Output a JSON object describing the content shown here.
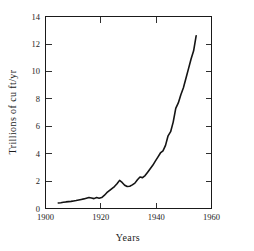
{
  "chart_data": {
    "type": "line",
    "title": "",
    "subtitle": "",
    "xlabel": "Years",
    "ylabel": "Trillions of cu ft/yr",
    "xlim": [
      1900,
      1965
    ],
    "ylim": [
      0,
      14
    ],
    "xticks": [
      1900,
      1920,
      1940,
      1960
    ],
    "xtick_labels": [
      "1900",
      "1920",
      "1940",
      "1960"
    ],
    "yticks": [
      0,
      2,
      4,
      6,
      8,
      10,
      12,
      14
    ],
    "ytick_labels": [
      "0",
      "2",
      "4",
      "6",
      "8",
      "10",
      "12",
      "14"
    ],
    "grid": false,
    "legend": false,
    "legend_position": "none",
    "frame": "box",
    "tick_direction": "in",
    "line_color": "#141414",
    "series": [
      {
        "name": "Natural gas production",
        "x": [
          1905,
          1906,
          1907,
          1908,
          1909,
          1910,
          1911,
          1912,
          1913,
          1914,
          1915,
          1916,
          1917,
          1918,
          1919,
          1920,
          1921,
          1922,
          1923,
          1924,
          1925,
          1926,
          1927,
          1928,
          1929,
          1930,
          1931,
          1932,
          1933,
          1934,
          1935,
          1936,
          1937,
          1938,
          1939,
          1940,
          1941,
          1942,
          1943,
          1944,
          1945,
          1946,
          1947,
          1948,
          1949,
          1950,
          1951,
          1952,
          1953,
          1954,
          1955,
          1956,
          1957,
          1958,
          1959
        ],
        "values": [
          0.4,
          0.42,
          0.45,
          0.48,
          0.5,
          0.52,
          0.55,
          0.58,
          0.62,
          0.66,
          0.7,
          0.75,
          0.8,
          0.76,
          0.72,
          0.8,
          0.75,
          0.8,
          0.95,
          1.15,
          1.3,
          1.45,
          1.6,
          1.8,
          2.05,
          1.9,
          1.7,
          1.6,
          1.62,
          1.72,
          1.85,
          2.1,
          2.3,
          2.25,
          2.4,
          2.65,
          2.9,
          3.15,
          3.45,
          3.75,
          4.05,
          4.2,
          4.6,
          5.3,
          5.6,
          6.3,
          7.3,
          7.7,
          8.3,
          8.8,
          9.5,
          10.2,
          10.9,
          11.5,
          12.6
        ]
      }
    ]
  },
  "axes": {
    "y_title": "Trillions of cu ft/yr",
    "x_title": "Years"
  },
  "ytick_labels": {
    "t0": "0",
    "t1": "2",
    "t2": "4",
    "t3": "6",
    "t4": "8",
    "t5": "10",
    "t6": "12",
    "t7": "14"
  },
  "xtick_labels": {
    "t0": "1900",
    "t1": "1920",
    "t2": "1940",
    "t3": "1960"
  }
}
